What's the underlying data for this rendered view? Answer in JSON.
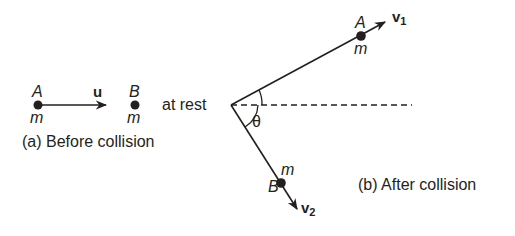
{
  "figure": {
    "panel_a": {
      "caption": "(a) Before collision",
      "ball_a": {
        "label": "A",
        "mass": "m"
      },
      "ball_b": {
        "label": "B",
        "mass": "m",
        "state": "at rest"
      },
      "velocity_label": "u"
    },
    "panel_b": {
      "caption": "(b) After collision",
      "ball_a": {
        "label": "A",
        "mass": "m",
        "velocity_label": "v",
        "velocity_sub": "1"
      },
      "ball_b": {
        "label": "B",
        "mass": "m",
        "velocity_label": "v",
        "velocity_sub": "2"
      },
      "angle_label": "θ"
    },
    "colors": {
      "ink": "#231f20",
      "background": "#ffffff"
    }
  }
}
